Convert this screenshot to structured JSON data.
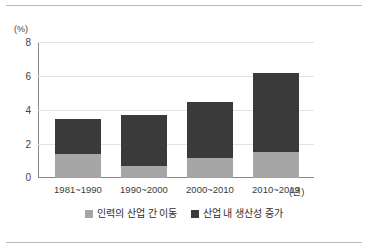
{
  "chart_data": {
    "type": "bar",
    "stacked": true,
    "title": "",
    "subtitle": "",
    "xlabel": "(년)",
    "ylabel": "(%)",
    "categories": [
      "1981~1990",
      "1990~2000",
      "2000~2010",
      "2010~2019"
    ],
    "series": [
      {
        "name": "인력의 산업 간 이동",
        "color": "#a6a6a6",
        "values": [
          1.4,
          0.7,
          1.2,
          1.55
        ]
      },
      {
        "name": "산업 내 생산성 증가",
        "color": "#3a3a3a",
        "values": [
          2.1,
          3.0,
          3.3,
          4.65
        ]
      }
    ],
    "totals": [
      3.5,
      3.7,
      4.5,
      6.2
    ],
    "ylim": [
      0,
      8
    ],
    "yticks": [
      0,
      2,
      4,
      6,
      8
    ],
    "ytick_labels": [
      "0",
      "2",
      "4",
      "6",
      "8"
    ],
    "grid": true,
    "grid_axis": "y",
    "legend_position": "bottom"
  },
  "axes": {
    "y_unit": "(%)",
    "x_unit": "(년)",
    "ticks": [
      {
        "value": 8,
        "label": "8"
      },
      {
        "value": 6,
        "label": "6"
      },
      {
        "value": 4,
        "label": "4"
      },
      {
        "value": 2,
        "label": "2"
      },
      {
        "value": 0,
        "label": "0"
      }
    ]
  },
  "legend": {
    "items": [
      {
        "label": "인력의 산업 간 이동",
        "color": "#a6a6a6"
      },
      {
        "label": "산업 내 생산성 증가",
        "color": "#3a3a3a"
      }
    ]
  },
  "colors": {
    "segment_lower": "#a6a6a6",
    "segment_upper": "#3a3a3a",
    "gridline": "#e3e3e3",
    "axis": "#888888",
    "rule": "#b9b9b9",
    "text": "#3b3b3b",
    "background": "#ffffff"
  }
}
